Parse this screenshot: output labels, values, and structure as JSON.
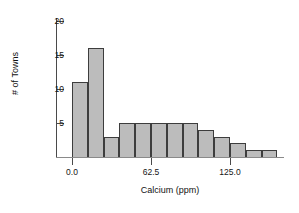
{
  "chart_data": {
    "type": "bar",
    "title": "",
    "subtitle": "",
    "xlabel": "Calcium (ppm)",
    "ylabel": "# of Towns",
    "grid": false,
    "legend": null,
    "bin_width": 12.5,
    "bin_starts": [
      0,
      12.5,
      25,
      37.5,
      50,
      62.5,
      75,
      87.5,
      100,
      112.5,
      125,
      137.5,
      150
    ],
    "categories": [
      "0–12.5",
      "12.5–25",
      "25–37.5",
      "37.5–50",
      "50–62.5",
      "62.5–75",
      "75–87.5",
      "87.5–100",
      "100–112.5",
      "112.5–125",
      "125–137.5",
      "137.5–150",
      "150–162.5"
    ],
    "values": [
      11,
      16,
      3,
      5,
      5,
      5,
      5,
      5,
      4,
      3,
      2,
      1,
      1
    ],
    "xlim": [
      -14,
      168
    ],
    "ylim": [
      0,
      21
    ],
    "xticks": [
      0.0,
      62.5,
      125.0
    ],
    "xtick_labels": [
      "0.0",
      "62.5",
      "125.0"
    ],
    "yticks": [
      5,
      10,
      15,
      20
    ],
    "ytick_labels": [
      "5",
      "10",
      "15",
      "20"
    ],
    "colors": {
      "bar_fill": "#bcbcbc",
      "bar_edge": "#3d3d3d",
      "axis": "#4a4a4a",
      "text": "#151515",
      "background": "#ffffff"
    }
  }
}
